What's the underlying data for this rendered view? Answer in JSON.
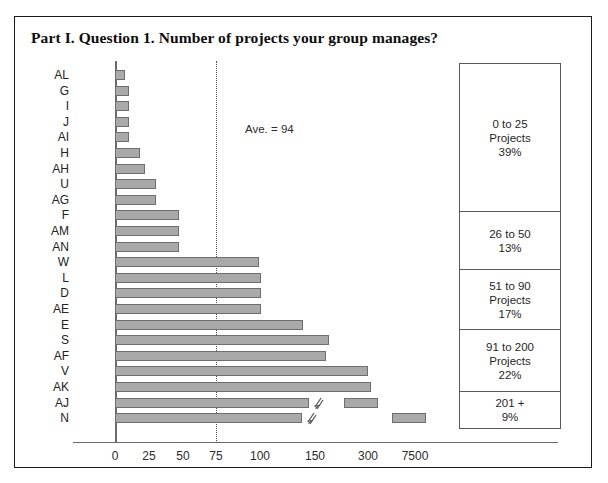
{
  "figure": {
    "title": "Part I. Question 1. Number of projects your group manages?",
    "annotation": "Ave. = 94"
  },
  "legend": {
    "boxes": [
      {
        "range": "0 to 25",
        "unit": "Projects",
        "percent": "39%",
        "height": 148
      },
      {
        "range": "26 to 50",
        "unit": "",
        "percent": "13%",
        "height": 58
      },
      {
        "range": "51 to 90",
        "unit": "Projects",
        "percent": "17%",
        "height": 60
      },
      {
        "range": "91 to 200",
        "unit": "Projects",
        "percent": "22%",
        "height": 62
      },
      {
        "range": "201 +",
        "unit": "",
        "percent": "9%",
        "height": 36
      }
    ]
  },
  "chart_data": {
    "type": "bar",
    "orientation": "horizontal",
    "title": "Part I. Question 1. Number of projects your group manages?",
    "xlabel": "",
    "ylabel": "",
    "grid": false,
    "legend_position": "right",
    "axis_note": "Broken x-axis: compressed scale beyond 150; ticks are non-linear (0,25,50,75,100,150,300,7500).",
    "xticks": [
      {
        "label": "0",
        "px": 42
      },
      {
        "label": "25",
        "px": 76
      },
      {
        "label": "50",
        "px": 110
      },
      {
        "label": "75",
        "px": 143
      },
      {
        "label": "100",
        "px": 187
      },
      {
        "label": "150",
        "px": 242
      },
      {
        "label": "300",
        "px": 295
      },
      {
        "label": "7500",
        "px": 342
      }
    ],
    "average": 94,
    "average_px": 143,
    "categories": [
      "AL",
      "G",
      "I",
      "J",
      "AI",
      "H",
      "AH",
      "U",
      "AG",
      "F",
      "AM",
      "AN",
      "W",
      "L",
      "D",
      "AE",
      "E",
      "S",
      "AF",
      "V",
      "AK",
      "AJ",
      "N"
    ],
    "values": [
      7,
      10,
      10,
      10,
      10,
      18,
      22,
      30,
      30,
      47,
      47,
      47,
      93,
      95,
      95,
      95,
      130,
      140,
      142,
      200,
      205,
      300,
      7500
    ],
    "bars": [
      {
        "label": "AL",
        "value": 7,
        "px": 10,
        "broken": false
      },
      {
        "label": "G",
        "value": 10,
        "px": 14,
        "broken": false
      },
      {
        "label": "I",
        "value": 10,
        "px": 14,
        "broken": false
      },
      {
        "label": "J",
        "value": 10,
        "px": 14,
        "broken": false
      },
      {
        "label": "AI",
        "value": 10,
        "px": 14,
        "broken": false
      },
      {
        "label": "H",
        "value": 18,
        "px": 25,
        "broken": false
      },
      {
        "label": "AH",
        "value": 22,
        "px": 30,
        "broken": false
      },
      {
        "label": "U",
        "value": 30,
        "px": 41,
        "broken": false
      },
      {
        "label": "AG",
        "value": 30,
        "px": 41,
        "broken": false
      },
      {
        "label": "F",
        "value": 47,
        "px": 64,
        "broken": false
      },
      {
        "label": "AM",
        "value": 47,
        "px": 64,
        "broken": false
      },
      {
        "label": "AN",
        "value": 47,
        "px": 64,
        "broken": false
      },
      {
        "label": "W",
        "value": 93,
        "px": 144,
        "broken": false
      },
      {
        "label": "L",
        "value": 95,
        "px": 146,
        "broken": false
      },
      {
        "label": "D",
        "value": 95,
        "px": 146,
        "broken": false
      },
      {
        "label": "AE",
        "value": 95,
        "px": 146,
        "broken": false
      },
      {
        "label": "E",
        "value": 130,
        "px": 188,
        "broken": false
      },
      {
        "label": "S",
        "value": 140,
        "px": 214,
        "broken": false
      },
      {
        "label": "AF",
        "value": 142,
        "px": 211,
        "broken": false
      },
      {
        "label": "V",
        "value": 200,
        "px": 253,
        "broken": false
      },
      {
        "label": "AK",
        "value": 205,
        "px": 256,
        "broken": false
      },
      {
        "label": "AJ",
        "value": 300,
        "px": 194,
        "broken": true,
        "seg2_x": 229,
        "seg2_w": 34
      },
      {
        "label": "N",
        "value": 7500,
        "px": 187,
        "broken": true,
        "seg2_x": 277,
        "seg2_w": 34
      }
    ]
  }
}
